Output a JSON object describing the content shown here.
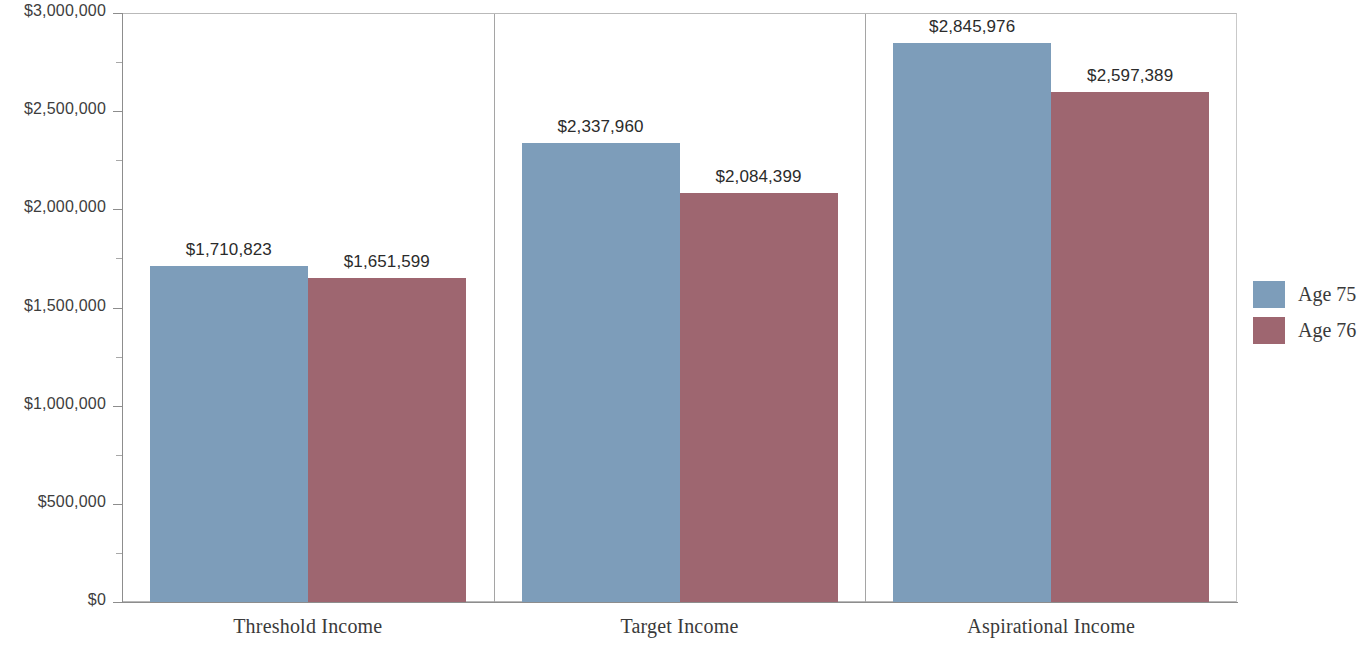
{
  "chart_data": {
    "type": "bar",
    "title": "",
    "subtitle": "",
    "xlabel": "",
    "ylabel": "",
    "categories": [
      "Threshold Income",
      "Target Income",
      "Aspirational Income"
    ],
    "series": [
      {
        "name": "Age 75",
        "color": "#7d9dba",
        "values": [
          1710823,
          2337960,
          2845976
        ],
        "value_labels": [
          "$1,710,823",
          "$2,337,960",
          "$2,845,976"
        ]
      },
      {
        "name": "Age 76",
        "color": "#9e6670",
        "values": [
          1651599,
          2084399,
          2597389
        ],
        "value_labels": [
          "$1,651,599",
          "$2,084,399",
          "$2,597,389"
        ]
      }
    ],
    "ylim": [
      0,
      3000000
    ],
    "y_major_ticks": [
      0,
      500000,
      1000000,
      1500000,
      2000000,
      2500000,
      3000000
    ],
    "y_minor_ticks": [
      250000,
      750000,
      1250000,
      1750000,
      2250000,
      2750000
    ],
    "y_tick_labels": [
      "$0",
      "$500,000",
      "$1,000,000",
      "$1,500,000",
      "$2,000,000",
      "$2,500,000",
      "$3,000,000"
    ],
    "grid": false,
    "legend_position": "right",
    "bar_grouping": "clustered",
    "value_labels_shown": true
  },
  "legend": {
    "entries": [
      {
        "label": "Age 75",
        "color": "#7d9dba"
      },
      {
        "label": "Age 76",
        "color": "#9e6670"
      }
    ]
  },
  "axis": {
    "y_labels": [
      "$3,000,000",
      "$2,500,000",
      "$2,000,000",
      "$1,500,000",
      "$1,000,000",
      "$500,000",
      "$0"
    ],
    "x_labels": [
      "Threshold Income",
      "Target Income",
      "Aspirational Income"
    ]
  },
  "colors": {
    "series_a": "#7d9dba",
    "series_b": "#9e6670",
    "axis": "#8d8d8d",
    "text": "#3a3a3a",
    "background": "#ffffff"
  }
}
